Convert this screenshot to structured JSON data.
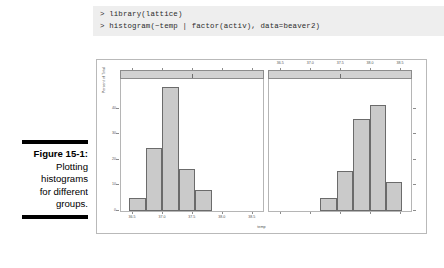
{
  "console": {
    "lines": [
      "> library(lattice)",
      "> histogram(~temp | factor(activ), data=beaver2)"
    ]
  },
  "caption": {
    "figure_number": "Figure 15-1:",
    "lines": [
      "Plotting",
      "histograms",
      "for different",
      "groups."
    ]
  },
  "chart_data": {
    "type": "bar",
    "title": "",
    "subtitle": "",
    "xlabel": "temp",
    "ylabel": "Percent of Total",
    "ylim": [
      0,
      50
    ],
    "xlim": [
      36.3,
      38.7
    ],
    "grid": false,
    "legend": "none",
    "panel_variable": "factor(activ)",
    "y_ticks": [
      "0",
      "10",
      "20",
      "30",
      "40"
    ],
    "y_tick_values": [
      0,
      10,
      20,
      30,
      40
    ],
    "x_ticks": [
      "36.5",
      "37.0",
      "37.5",
      "38.0",
      "38.5"
    ],
    "x_tick_values": [
      36.5,
      37.0,
      37.5,
      38.0,
      38.5
    ],
    "panels": [
      {
        "name": "panel-0",
        "strip_label": "0",
        "strip_tick_position": 0.5,
        "axis_side": "bottom",
        "categories": [
          "36.5",
          "36.75",
          "37.0",
          "37.25",
          "37.5"
        ],
        "bin_centers": [
          36.55,
          36.8,
          37.05,
          37.3,
          37.55
        ],
        "values": [
          5,
          24,
          47,
          16,
          8
        ]
      },
      {
        "name": "panel-1",
        "strip_label": "1",
        "strip_tick_position": 0.5,
        "axis_side": "top",
        "categories": [
          "37.5",
          "37.75",
          "38.0",
          "38.25",
          "38.5"
        ],
        "bin_centers": [
          37.55,
          37.8,
          38.05,
          38.3,
          38.55
        ],
        "values": [
          5,
          15,
          35,
          40,
          11
        ]
      }
    ]
  }
}
